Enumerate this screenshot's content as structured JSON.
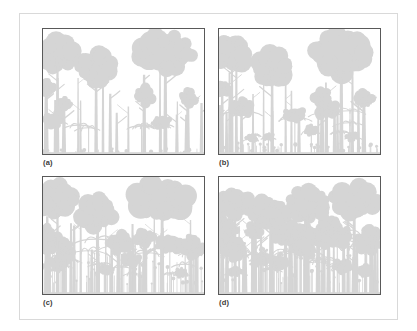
{
  "figure": {
    "kind": "forest-profile-diagram-set",
    "panel_count": 4,
    "layout": "2x2",
    "colors": {
      "silhouette": "#d5d5d5",
      "silhouette_shadow": "#cbcbcb",
      "panel_border": "#595959",
      "outer_border": "#d9d9d9",
      "background": "#ffffff",
      "label_text": "#3a3a3a"
    }
  },
  "panels": [
    {
      "id": "a",
      "label": "(a)",
      "description": "Tall closed forest: two emergent crowns, open understory, sparse ground herbs",
      "ground_level": 0.985
    },
    {
      "id": "b",
      "label": "(b)",
      "description": "Tall closed forest with scattered low shrubs and ground-layer seedlings",
      "ground_level": 0.985
    },
    {
      "id": "c",
      "label": "(c)",
      "description": "Forest with dense developed understory layer of small palms and saplings",
      "ground_level": 0.985
    },
    {
      "id": "d",
      "label": "(d)",
      "description": "Dense multi-layered forest with continuous closed canopy and many slender trunks",
      "ground_level": 0.985
    }
  ],
  "chart_data": {
    "type": "area",
    "title": "",
    "xlabel": "",
    "ylabel": "",
    "panels": [
      {
        "id": "a",
        "label": "(a)",
        "emergent_crowns": [
          {
            "x": 0.09,
            "crown_w": 0.23,
            "crown_h": 0.26,
            "top": 0.07,
            "trunk_w": 0.013
          },
          {
            "x": 0.33,
            "crown_w": 0.22,
            "crown_h": 0.26,
            "top": 0.18,
            "trunk_w": 0.014
          },
          {
            "x": 0.76,
            "crown_w": 0.34,
            "crown_h": 0.34,
            "top": 0.02,
            "trunk_w": 0.016
          }
        ],
        "canopy_trees": [
          {
            "x": 0.02,
            "crown_w": 0.1,
            "crown_h": 0.13,
            "top": 0.4
          },
          {
            "x": 0.13,
            "crown_w": 0.09,
            "crown_h": 0.11,
            "top": 0.55
          },
          {
            "x": 0.63,
            "crown_w": 0.11,
            "crown_h": 0.14,
            "top": 0.46
          },
          {
            "x": 0.9,
            "crown_w": 0.1,
            "crown_h": 0.12,
            "top": 0.49
          }
        ],
        "understory_density": 0.25,
        "ground_layer_density": 0.35,
        "ground_layer_height": 0.035
      },
      {
        "id": "b",
        "label": "(b)",
        "emergent_crowns": [
          {
            "x": 0.08,
            "crown_w": 0.23,
            "crown_h": 0.26,
            "top": 0.07,
            "trunk_w": 0.013
          },
          {
            "x": 0.33,
            "crown_w": 0.22,
            "crown_h": 0.27,
            "top": 0.18,
            "trunk_w": 0.014
          },
          {
            "x": 0.76,
            "crown_w": 0.33,
            "crown_h": 0.33,
            "top": 0.03,
            "trunk_w": 0.016
          }
        ],
        "canopy_trees": [
          {
            "x": 0.02,
            "crown_w": 0.1,
            "crown_h": 0.13,
            "top": 0.41
          },
          {
            "x": 0.14,
            "crown_w": 0.09,
            "crown_h": 0.11,
            "top": 0.56
          },
          {
            "x": 0.64,
            "crown_w": 0.11,
            "crown_h": 0.14,
            "top": 0.47
          },
          {
            "x": 0.9,
            "crown_w": 0.1,
            "crown_h": 0.12,
            "top": 0.5
          }
        ],
        "understory_density": 0.35,
        "ground_layer_density": 0.6,
        "ground_layer_height": 0.075
      },
      {
        "id": "c",
        "label": "(c)",
        "emergent_crowns": [
          {
            "x": 0.09,
            "crown_w": 0.24,
            "crown_h": 0.27,
            "top": 0.06,
            "trunk_w": 0.013
          },
          {
            "x": 0.34,
            "crown_w": 0.22,
            "crown_h": 0.27,
            "top": 0.17,
            "trunk_w": 0.014
          },
          {
            "x": 0.74,
            "crown_w": 0.35,
            "crown_h": 0.35,
            "top": 0.02,
            "trunk_w": 0.016
          }
        ],
        "canopy_trees": [
          {
            "x": 0.02,
            "crown_w": 0.1,
            "crown_h": 0.13,
            "top": 0.42
          },
          {
            "x": 0.13,
            "crown_w": 0.1,
            "crown_h": 0.12,
            "top": 0.53
          },
          {
            "x": 0.63,
            "crown_w": 0.11,
            "crown_h": 0.14,
            "top": 0.45
          },
          {
            "x": 0.92,
            "crown_w": 0.1,
            "crown_h": 0.12,
            "top": 0.5
          }
        ],
        "understory_density": 0.75,
        "ground_layer_density": 0.85,
        "ground_layer_height": 0.3
      },
      {
        "id": "d",
        "label": "(d)",
        "emergent_crowns": [
          {
            "x": 0.1,
            "crown_w": 0.22,
            "crown_h": 0.22,
            "top": 0.13,
            "trunk_w": 0.013
          },
          {
            "x": 0.32,
            "crown_w": 0.24,
            "crown_h": 0.24,
            "top": 0.18,
            "trunk_w": 0.014
          },
          {
            "x": 0.55,
            "crown_w": 0.26,
            "crown_h": 0.26,
            "top": 0.1,
            "trunk_w": 0.015
          },
          {
            "x": 0.84,
            "crown_w": 0.3,
            "crown_h": 0.28,
            "top": 0.06,
            "trunk_w": 0.016
          }
        ],
        "canopy_trees": [
          {
            "x": 0.02,
            "crown_w": 0.11,
            "crown_h": 0.14,
            "top": 0.36
          },
          {
            "x": 0.22,
            "crown_w": 0.11,
            "crown_h": 0.13,
            "top": 0.4
          },
          {
            "x": 0.45,
            "crown_w": 0.12,
            "crown_h": 0.14,
            "top": 0.38
          },
          {
            "x": 0.68,
            "crown_w": 0.11,
            "crown_h": 0.13,
            "top": 0.34
          },
          {
            "x": 0.95,
            "crown_w": 0.11,
            "crown_h": 0.13,
            "top": 0.42
          }
        ],
        "understory_density": 0.95,
        "ground_layer_density": 0.9,
        "ground_layer_height": 0.34
      }
    ]
  }
}
